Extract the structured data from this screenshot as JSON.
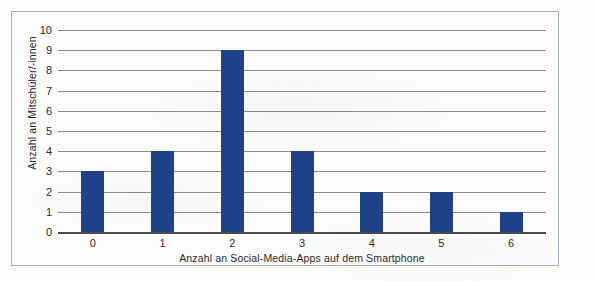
{
  "chart_data": {
    "type": "bar",
    "title": "",
    "categories": [
      "0",
      "1",
      "2",
      "3",
      "4",
      "5",
      "6"
    ],
    "values": [
      3,
      4,
      9,
      4,
      2,
      2,
      1
    ],
    "series": [
      {
        "name": "Anzahl an Mitschüler/-innen",
        "values": [
          3,
          4,
          9,
          4,
          2,
          2,
          1
        ]
      }
    ],
    "xlabel": "Anzahl an Social-Media-Apps auf dem Smartphone",
    "ylabel": "Anzahl an Mitschüler/-innen",
    "ylim": [
      0,
      10
    ],
    "yticks": [
      0,
      1,
      2,
      3,
      4,
      5,
      6,
      7,
      8,
      9,
      10
    ],
    "ytick_labels": [
      "0",
      "1",
      "2",
      "3",
      "4",
      "5",
      "6",
      "7",
      "8",
      "9",
      "10"
    ],
    "xtick_labels": [
      "0",
      "1",
      "2",
      "3",
      "4",
      "5",
      "6"
    ],
    "grid": true,
    "grid_axis": "y",
    "legend": false,
    "legend_position": "none",
    "bar_color": "#1f4189",
    "grid_color": "#8d8d8d",
    "axis_color": "#4a4a4a",
    "frame_color": "#a8b0c6",
    "background_color": "#fcfcfa"
  }
}
